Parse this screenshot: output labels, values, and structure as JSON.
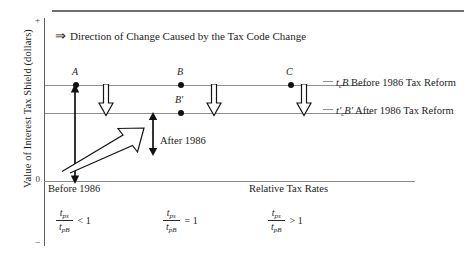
{
  "figure": {
    "title_note": {
      "arrow_icon": "double-right-arrow",
      "arrow_glyph": "⇒",
      "text": "Direction of Change Caused by the Tax Code Change"
    },
    "y_axis": {
      "title": "Value of Interest Tax Shield (dollars)",
      "ticks": {
        "top": "+",
        "middle": "0",
        "bottom": "–"
      }
    },
    "x_axis": {
      "title": "Relative Tax Rates"
    },
    "points": [
      {
        "name": "A",
        "label": "A",
        "line": "before"
      },
      {
        "name": "B",
        "label": "B",
        "line": "before"
      },
      {
        "name": "Bp",
        "label": "B′",
        "line": "after"
      },
      {
        "name": "C",
        "label": "C",
        "line": "before"
      }
    ],
    "level_labels": {
      "before": {
        "expr_t": "t",
        "expr_t_sub": "c",
        "expr_b": "B",
        "text": "Before 1986 Tax Reform"
      },
      "after": {
        "expr_t": "t′",
        "expr_t_sub": "c",
        "expr_b": "B′",
        "text": "After 1986 Tax Reform"
      }
    },
    "annotations": {
      "before_1986": "Before 1986",
      "after_1986": "After 1986"
    },
    "expressions": [
      {
        "num_t": "t",
        "num_sub": "ps",
        "den_t": "t",
        "den_sub": "pB",
        "operator": "< 1"
      },
      {
        "num_t": "t",
        "num_sub": "ps",
        "den_t": "t",
        "den_sub": "pB",
        "operator": "= 1"
      },
      {
        "num_t": "t",
        "num_sub": "ps",
        "den_t": "t",
        "den_sub": "pB",
        "operator": "> 1"
      }
    ],
    "colors": {
      "ink": "#1d1d1d",
      "rule": "#6f6f6f",
      "axis": "#5d5d5d",
      "level_line": "#8f8f8f"
    }
  }
}
